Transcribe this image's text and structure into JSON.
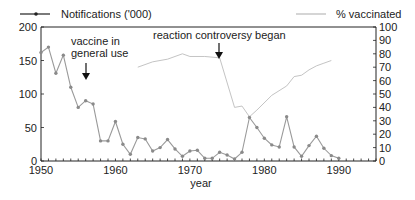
{
  "chart_data": {
    "type": "line",
    "title": "",
    "xlabel": "year",
    "ylabel_left": "",
    "ylabel_right": "",
    "xlim": [
      1950,
      1995
    ],
    "ylim_left": [
      0,
      200
    ],
    "ylim_right": [
      0,
      100
    ],
    "x_ticks": [
      1950,
      1960,
      1970,
      1980,
      1990
    ],
    "y_ticks_left": [
      0,
      50,
      100,
      150,
      200
    ],
    "y_ticks_right": [
      0,
      10,
      20,
      30,
      40,
      50,
      60,
      70,
      80,
      90,
      100
    ],
    "grid": false,
    "legend": [
      {
        "name": "Notifications ('000)",
        "placement": "top-left",
        "style": "solid-with-markers"
      },
      {
        "name": "% vaccinated",
        "placement": "top-right",
        "style": "thin-line"
      }
    ],
    "series": [
      {
        "name": "Notifications ('000)",
        "axis": "left",
        "color": "#9a9a9a",
        "x": [
          1950,
          1951,
          1952,
          1953,
          1954,
          1955,
          1956,
          1957,
          1958,
          1959,
          1960,
          1961,
          1962,
          1963,
          1964,
          1965,
          1966,
          1967,
          1968,
          1969,
          1970,
          1971,
          1972,
          1973,
          1974,
          1975,
          1976,
          1977,
          1978,
          1979,
          1980,
          1981,
          1982,
          1983,
          1984,
          1985,
          1986,
          1987,
          1988,
          1989,
          1990
        ],
        "values": [
          162,
          170,
          131,
          158,
          110,
          80,
          90,
          85,
          30,
          30,
          59,
          25,
          10,
          35,
          33,
          15,
          20,
          32,
          18,
          7,
          15,
          16,
          4,
          4,
          13,
          9,
          3,
          13,
          65,
          50,
          34,
          24,
          21,
          66,
          21,
          7,
          23,
          37,
          19,
          8,
          4
        ]
      },
      {
        "name": "% vaccinated",
        "axis": "right",
        "color": "#c4c4c4",
        "x": [
          1963,
          1965,
          1967,
          1968,
          1969,
          1970,
          1972,
          1974,
          1976,
          1977,
          1978,
          1979,
          1981,
          1983,
          1984,
          1985,
          1986,
          1987,
          1988,
          1989
        ],
        "values": [
          70,
          74,
          76,
          78,
          80,
          78,
          78,
          77,
          40,
          41,
          33,
          38,
          49,
          56,
          63,
          64,
          68,
          71,
          73,
          75
        ]
      }
    ],
    "annotations": [
      {
        "text_lines": [
          "vaccine in",
          "general use"
        ],
        "x": 1956.5,
        "arrow": true
      },
      {
        "text_lines": [
          "reaction controversy began"
        ],
        "x": 1974,
        "arrow": true
      }
    ]
  }
}
